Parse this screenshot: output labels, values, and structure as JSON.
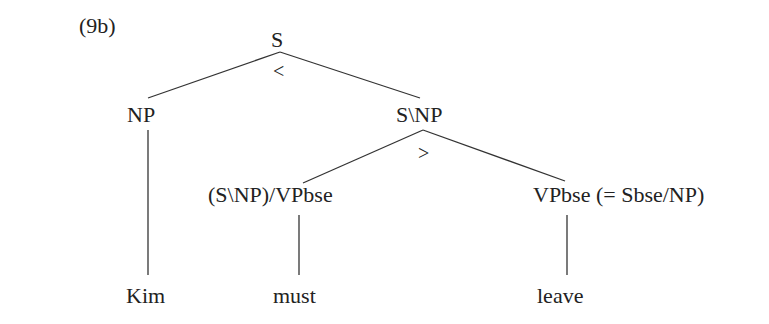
{
  "example_label": "(9b)",
  "tree": {
    "root": {
      "label": "S",
      "combinator": "<"
    },
    "np": {
      "label": "NP",
      "leaf": "Kim"
    },
    "vp": {
      "label": "S\\NP",
      "combinator": ">"
    },
    "modal": {
      "label": "(S\\NP)/VPbse",
      "leaf": "must"
    },
    "vpbse": {
      "label": "VPbse (= Sbse/NP)",
      "leaf": "leave"
    }
  },
  "colors": {
    "ink": "#222222",
    "background": "#ffffff"
  }
}
